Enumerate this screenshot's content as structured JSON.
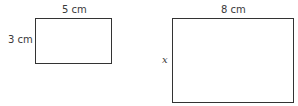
{
  "diagram": {
    "shapes": [
      {
        "type": "rectangle",
        "label_top": "5 cm",
        "label_left": "3 cm",
        "width_value": 5,
        "height_value": 3,
        "unit": "cm"
      },
      {
        "type": "rectangle",
        "label_top": "8 cm",
        "label_left": "x",
        "width_value": 8,
        "height_value": "x",
        "unit": "cm"
      }
    ],
    "colors": {
      "stroke": "#333333",
      "text": "#3a3a3a",
      "background": "#ffffff"
    }
  }
}
